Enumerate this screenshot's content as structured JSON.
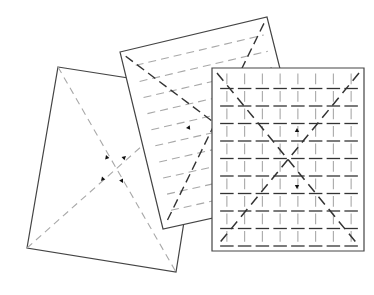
{
  "colors": {
    "outline": "#444444",
    "paper": "#ffffff",
    "light_dash": "#a8a8a8",
    "dark_dash": "#333333",
    "arrow": "#111111"
  },
  "sheets": [
    {
      "name": "left-sheet",
      "pattern": "diagonal-x-light",
      "arrows": 4
    },
    {
      "name": "middle-sheet",
      "pattern": "horizontal-lines-with-dark-diagonal-x",
      "arrows": 1,
      "horizontal_lines": 10
    },
    {
      "name": "right-sheet",
      "pattern": "grid-with-dark-diagonal-x",
      "arrows": 2,
      "grid_columns": 8,
      "grid_rows": 10
    }
  ]
}
